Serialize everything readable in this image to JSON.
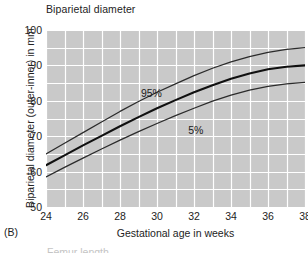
{
  "figure": {
    "panel_label": "(B)",
    "title": "Biparietal diameter",
    "clipped_next_caption": "Femur length"
  },
  "colors": {
    "plot_background": "#c9c9c9",
    "gridline": "#ffffff",
    "curve_median": "#101010",
    "curve_percentile": "#2b2b2b",
    "text": "#232323",
    "page_background": "#ffffff"
  },
  "chart_data": {
    "type": "line",
    "title": "Biparietal diameter",
    "xlabel": "Gestational age in weeks",
    "ylabel": "Biparietal diameter (outer-inner) in mm",
    "xlim": [
      24,
      38
    ],
    "ylim": [
      50,
      100
    ],
    "xticks": [
      24,
      26,
      28,
      30,
      32,
      34,
      36,
      38
    ],
    "yticks": [
      50,
      60,
      70,
      80,
      90,
      100
    ],
    "xtick_labels": [
      "24",
      "26",
      "28",
      "30",
      "32",
      "34",
      "36",
      "38"
    ],
    "ytick_labels": [
      "50",
      "60",
      "70",
      "80",
      "90",
      "100"
    ],
    "grid": true,
    "grid_x_step": 1,
    "grid_y_step": 5,
    "legend": "none",
    "annotations": [
      {
        "text": "95%",
        "x": 29.7,
        "y": 82.3
      },
      {
        "text": "5%",
        "x": 32.1,
        "y": 71.8
      }
    ],
    "x": [
      24,
      25,
      26,
      27,
      28,
      29,
      30,
      31,
      32,
      33,
      34,
      35,
      36,
      37,
      38
    ],
    "series": [
      {
        "name": "95%",
        "style": "thin",
        "values": [
          65.0,
          68.0,
          71.0,
          74.0,
          77.0,
          79.8,
          82.4,
          84.8,
          87.1,
          89.2,
          91.0,
          92.5,
          93.7,
          94.5,
          95.0
        ]
      },
      {
        "name": "median",
        "style": "thick",
        "values": [
          61.8,
          64.6,
          67.4,
          70.1,
          72.8,
          75.4,
          77.9,
          80.2,
          82.4,
          84.4,
          86.2,
          87.7,
          88.9,
          89.6,
          90.0
        ]
      },
      {
        "name": "5%",
        "style": "thin",
        "values": [
          58.5,
          61.2,
          63.8,
          66.4,
          68.9,
          71.3,
          73.6,
          75.8,
          77.9,
          79.9,
          81.6,
          83.0,
          84.1,
          84.8,
          85.2
        ]
      }
    ]
  }
}
